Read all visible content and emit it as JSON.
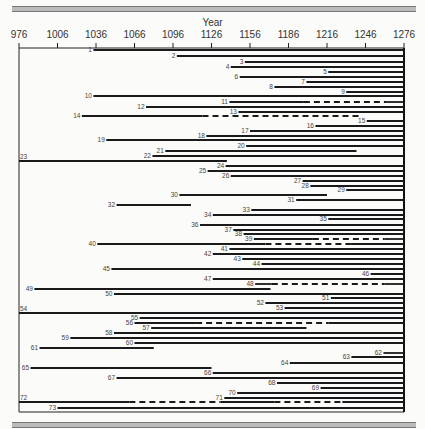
{
  "header": {
    "title_cut_text": ""
  },
  "chart_data": {
    "type": "gantt-timeline",
    "title": "",
    "xlabel": "Year",
    "ylabel": "",
    "xlim": [
      976,
      1276
    ],
    "x_ticks": [
      976,
      1006,
      1036,
      1066,
      1096,
      1126,
      1156,
      1186,
      1216,
      1246,
      1276
    ],
    "grid": false,
    "legend": "none",
    "style_notes": "solid segments = continuous record, dashed segments = gap/uncertain",
    "groups": [
      {
        "divider_row": 23,
        "rows_from": 1,
        "rows_to": 22
      },
      {
        "divider_row": 54,
        "rows_from": 24,
        "rows_to": 53
      },
      {
        "divider_row": 72,
        "rows_from": 55,
        "rows_to": 73
      }
    ],
    "series": [
      {
        "id": 1,
        "start": 1034,
        "end": 1276,
        "y": 50,
        "dashed": []
      },
      {
        "id": 2,
        "start": 1099,
        "end": 1276,
        "y": 56,
        "dashed": []
      },
      {
        "id": 3,
        "start": 1152,
        "end": 1276,
        "y": 62,
        "dashed": []
      },
      {
        "id": 4,
        "start": 1141,
        "end": 1276,
        "y": 67,
        "dashed": []
      },
      {
        "id": 5,
        "start": 1217,
        "end": 1276,
        "y": 72,
        "dashed": []
      },
      {
        "id": 6,
        "start": 1148,
        "end": 1276,
        "y": 77,
        "dashed": []
      },
      {
        "id": 7,
        "start": 1200,
        "end": 1276,
        "y": 82,
        "dashed": []
      },
      {
        "id": 8,
        "start": 1175,
        "end": 1276,
        "y": 87,
        "dashed": []
      },
      {
        "id": 9,
        "start": 1231,
        "end": 1276,
        "y": 92,
        "dashed": []
      },
      {
        "id": 10,
        "start": 1034,
        "end": 1276,
        "y": 96,
        "dashed": []
      },
      {
        "id": 11,
        "start": 1140,
        "end": 1276,
        "y": 102,
        "dashed": [
          [
            1198,
            1262
          ]
        ]
      },
      {
        "id": 12,
        "start": 1075,
        "end": 1276,
        "y": 107,
        "dashed": []
      },
      {
        "id": 13,
        "start": 1147,
        "end": 1276,
        "y": 112,
        "dashed": []
      },
      {
        "id": 14,
        "start": 1025,
        "end": 1242,
        "y": 116,
        "dashed": [
          [
            1119,
            1242
          ]
        ]
      },
      {
        "id": 15,
        "start": 1247,
        "end": 1276,
        "y": 121,
        "dashed": []
      },
      {
        "id": 16,
        "start": 1207,
        "end": 1276,
        "y": 126,
        "dashed": []
      },
      {
        "id": 17,
        "start": 1156,
        "end": 1276,
        "y": 131,
        "dashed": []
      },
      {
        "id": 18,
        "start": 1122,
        "end": 1276,
        "y": 136,
        "dashed": []
      },
      {
        "id": 19,
        "start": 1044,
        "end": 1276,
        "y": 140,
        "dashed": []
      },
      {
        "id": 20,
        "start": 1153,
        "end": 1276,
        "y": 146,
        "dashed": []
      },
      {
        "id": 21,
        "start": 1090,
        "end": 1239,
        "y": 151,
        "dashed": []
      },
      {
        "id": 22,
        "start": 1080,
        "end": 1276,
        "y": 156,
        "dashed": []
      },
      {
        "id": 23,
        "start": 976,
        "end": 1138,
        "y": 161,
        "dashed": [],
        "divider": true,
        "label_left": true
      },
      {
        "id": 24,
        "start": 1137,
        "end": 1276,
        "y": 166,
        "dashed": []
      },
      {
        "id": 25,
        "start": 1123,
        "end": 1276,
        "y": 171,
        "dashed": []
      },
      {
        "id": 26,
        "start": 1141,
        "end": 1276,
        "y": 176,
        "dashed": []
      },
      {
        "id": 27,
        "start": 1197,
        "end": 1276,
        "y": 181,
        "dashed": []
      },
      {
        "id": 28,
        "start": 1203,
        "end": 1276,
        "y": 186,
        "dashed": []
      },
      {
        "id": 29,
        "start": 1231,
        "end": 1276,
        "y": 190,
        "dashed": []
      },
      {
        "id": 30,
        "start": 1101,
        "end": 1216,
        "y": 195,
        "dashed": []
      },
      {
        "id": 31,
        "start": 1192,
        "end": 1276,
        "y": 200,
        "dashed": []
      },
      {
        "id": 32,
        "start": 1052,
        "end": 1110,
        "y": 205,
        "dashed": []
      },
      {
        "id": 33,
        "start": 1157,
        "end": 1276,
        "y": 210,
        "dashed": []
      },
      {
        "id": 34,
        "start": 1127,
        "end": 1276,
        "y": 215,
        "dashed": []
      },
      {
        "id": 35,
        "start": 1217,
        "end": 1276,
        "y": 219,
        "dashed": []
      },
      {
        "id": 36,
        "start": 1117,
        "end": 1276,
        "y": 225,
        "dashed": []
      },
      {
        "id": 37,
        "start": 1143,
        "end": 1276,
        "y": 230,
        "dashed": []
      },
      {
        "id": 38,
        "start": 1151,
        "end": 1276,
        "y": 234,
        "dashed": []
      },
      {
        "id": 39,
        "start": 1159,
        "end": 1276,
        "y": 239,
        "dashed": [
          [
            1205,
            1261
          ]
        ]
      },
      {
        "id": 40,
        "start": 1037,
        "end": 1276,
        "y": 244,
        "dashed": [
          [
            1168,
            1234
          ]
        ]
      },
      {
        "id": 41,
        "start": 1140,
        "end": 1276,
        "y": 249,
        "dashed": []
      },
      {
        "id": 42,
        "start": 1127,
        "end": 1276,
        "y": 254,
        "dashed": []
      },
      {
        "id": 43,
        "start": 1150,
        "end": 1276,
        "y": 259,
        "dashed": []
      },
      {
        "id": 44,
        "start": 1165,
        "end": 1276,
        "y": 264,
        "dashed": []
      },
      {
        "id": 45,
        "start": 1048,
        "end": 1276,
        "y": 269,
        "dashed": []
      },
      {
        "id": 46,
        "start": 1250,
        "end": 1276,
        "y": 274,
        "dashed": []
      },
      {
        "id": 47,
        "start": 1127,
        "end": 1276,
        "y": 279,
        "dashed": []
      },
      {
        "id": 48,
        "start": 1160,
        "end": 1276,
        "y": 284,
        "dashed": [
          [
            1173,
            1261
          ]
        ]
      },
      {
        "id": 49,
        "start": 988,
        "end": 1172,
        "y": 289,
        "dashed": []
      },
      {
        "id": 50,
        "start": 1050,
        "end": 1276,
        "y": 294,
        "dashed": []
      },
      {
        "id": 51,
        "start": 1219,
        "end": 1276,
        "y": 298,
        "dashed": []
      },
      {
        "id": 52,
        "start": 1168,
        "end": 1276,
        "y": 303,
        "dashed": []
      },
      {
        "id": 53,
        "start": 1183,
        "end": 1276,
        "y": 308,
        "dashed": []
      },
      {
        "id": 54,
        "start": 976,
        "end": 1276,
        "y": 313,
        "dashed": [],
        "divider": true,
        "label_left": true
      },
      {
        "id": 55,
        "start": 1070,
        "end": 1276,
        "y": 318,
        "dashed": []
      },
      {
        "id": 56,
        "start": 1066,
        "end": 1276,
        "y": 323,
        "dashed": [
          [
            1114,
            1217
          ]
        ]
      },
      {
        "id": 57,
        "start": 1079,
        "end": 1200,
        "y": 328,
        "dashed": []
      },
      {
        "id": 58,
        "start": 1050,
        "end": 1276,
        "y": 333,
        "dashed": []
      },
      {
        "id": 59,
        "start": 1016,
        "end": 1276,
        "y": 338,
        "dashed": []
      },
      {
        "id": 60,
        "start": 1066,
        "end": 1276,
        "y": 343,
        "dashed": []
      },
      {
        "id": 61,
        "start": 992,
        "end": 1081,
        "y": 348,
        "dashed": []
      },
      {
        "id": 62,
        "start": 1260,
        "end": 1276,
        "y": 353,
        "dashed": []
      },
      {
        "id": 63,
        "start": 1235,
        "end": 1276,
        "y": 357,
        "dashed": []
      },
      {
        "id": 64,
        "start": 1187,
        "end": 1276,
        "y": 363,
        "dashed": []
      },
      {
        "id": 65,
        "start": 985,
        "end": 1126,
        "y": 368,
        "dashed": []
      },
      {
        "id": 66,
        "start": 1127,
        "end": 1276,
        "y": 373,
        "dashed": []
      },
      {
        "id": 67,
        "start": 1052,
        "end": 1276,
        "y": 378,
        "dashed": []
      },
      {
        "id": 68,
        "start": 1177,
        "end": 1276,
        "y": 383,
        "dashed": []
      },
      {
        "id": 69,
        "start": 1211,
        "end": 1276,
        "y": 388,
        "dashed": []
      },
      {
        "id": 70,
        "start": 1146,
        "end": 1276,
        "y": 393,
        "dashed": []
      },
      {
        "id": 71,
        "start": 1136,
        "end": 1276,
        "y": 398,
        "dashed": []
      },
      {
        "id": 72,
        "start": 976,
        "end": 1276,
        "y": 402,
        "dashed": [
          [
            1062,
            1133
          ],
          [
            1175,
            1228
          ]
        ],
        "divider": true,
        "label_left": true
      },
      {
        "id": 73,
        "start": 1006,
        "end": 1276,
        "y": 408,
        "dashed": []
      }
    ]
  }
}
